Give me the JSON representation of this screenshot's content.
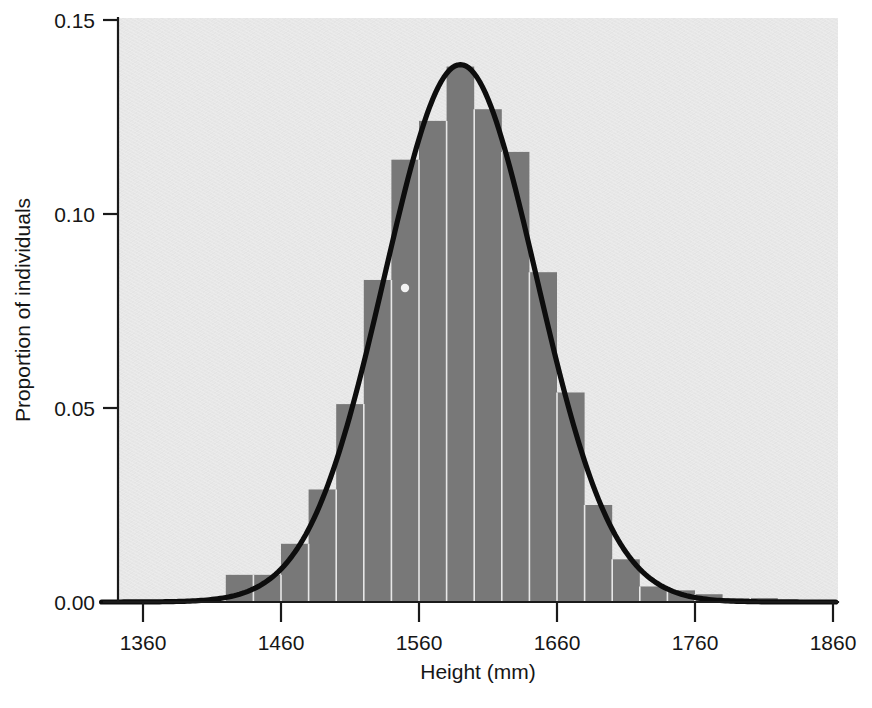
{
  "chart_data": {
    "type": "bar",
    "title": "",
    "subtitle": "",
    "xlabel": "Height (mm)",
    "ylabel": "Proportion of individuals",
    "xlim": [
      1330,
      1860
    ],
    "ylim": [
      0.0,
      0.15
    ],
    "xticks": [
      1360,
      1460,
      1560,
      1660,
      1760,
      1860
    ],
    "xticklabels": [
      "1360",
      "1460",
      "1560",
      "1660",
      "1760",
      "1860"
    ],
    "yticks": [
      0.0,
      0.05,
      0.1,
      0.15
    ],
    "yticklabels": [
      "0.00",
      "0.05",
      "0.10",
      "0.15"
    ],
    "grid": false,
    "legend": null,
    "bin_width": 20,
    "bar_color": "#787878",
    "plot_background": "#e7e7e7",
    "categories": [
      1430,
      1450,
      1470,
      1490,
      1510,
      1530,
      1550,
      1570,
      1590,
      1610,
      1630,
      1650,
      1670,
      1690,
      1710,
      1730,
      1750,
      1770,
      1790,
      1810
    ],
    "values": [
      0.007,
      0.007,
      0.015,
      0.029,
      0.051,
      0.083,
      0.114,
      0.124,
      0.138,
      0.127,
      0.116,
      0.085,
      0.054,
      0.025,
      0.011,
      0.004,
      0.003,
      0.002,
      0.001,
      0.001
    ],
    "series": [
      {
        "name": "Histogram of heights",
        "type": "bar",
        "categories": [
          1430,
          1450,
          1470,
          1490,
          1510,
          1530,
          1550,
          1570,
          1590,
          1610,
          1630,
          1650,
          1670,
          1690,
          1710,
          1730,
          1750,
          1770,
          1790,
          1810
        ],
        "values": [
          0.007,
          0.007,
          0.015,
          0.029,
          0.051,
          0.083,
          0.114,
          0.124,
          0.138,
          0.127,
          0.116,
          0.085,
          0.054,
          0.025,
          0.011,
          0.004,
          0.003,
          0.002,
          0.001,
          0.001
        ]
      },
      {
        "name": "Fitted normal curve",
        "type": "line",
        "color": "#0d0d0d",
        "mean": 1590,
        "sd": 55,
        "peak": 0.1385
      }
    ],
    "annotations": []
  },
  "axes": {
    "y_title": "Proportion of individuals",
    "x_title": "Height (mm)",
    "y_labels": [
      "0.15",
      "0.10",
      "0.05",
      "0.00"
    ],
    "x_labels": [
      "1360",
      "1460",
      "1560",
      "1660",
      "1760",
      "1860"
    ]
  }
}
